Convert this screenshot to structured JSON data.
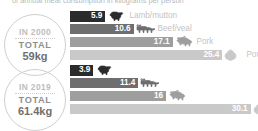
{
  "caption": "of annual meat consumption in kilograms per person",
  "colors": {
    "lamb": "#2b2b2b",
    "beef": "#6e6e6e",
    "pork": "#9e9e9e",
    "poultry": "#c9c9c9",
    "label_text": "#c4c4c4",
    "badge_border": "#cfcfcf",
    "value_text": "#ffffff"
  },
  "badges": [
    {
      "year_label": "IN 2000",
      "total_label": "TOTAL",
      "total_value": "59kg"
    },
    {
      "year_label": "IN 2019",
      "total_label": "TOTAL",
      "total_value": "61.4kg"
    }
  ],
  "groups": [
    {
      "name": "in-2000",
      "rows": [
        {
          "value": "5.9",
          "label": "Lamb/mutton",
          "icon": "sheep-icon",
          "color_key": "lamb",
          "show_label": true
        },
        {
          "value": "10.6",
          "label": "Beef/veal",
          "icon": "cow-icon",
          "color_key": "beef",
          "show_label": true
        },
        {
          "value": "17.1",
          "label": "Pork",
          "icon": "pig-icon",
          "color_key": "pork",
          "show_label": true
        },
        {
          "value": "25.4",
          "label": "Poultry",
          "icon": "chicken-icon",
          "color_key": "poultry",
          "show_label": true
        }
      ]
    },
    {
      "name": "in-2019",
      "rows": [
        {
          "value": "3.9",
          "label": "Lamb/mutton",
          "icon": "sheep-icon",
          "color_key": "lamb",
          "show_label": false
        },
        {
          "value": "11.4",
          "label": "Beef/veal",
          "icon": "cow-icon",
          "color_key": "beef",
          "show_label": false
        },
        {
          "value": "16",
          "label": "Pork",
          "icon": "pig-icon",
          "color_key": "pork",
          "show_label": false
        },
        {
          "value": "30.1",
          "label": "Poultry",
          "icon": "chicken-icon",
          "color_key": "poultry",
          "show_label": false
        }
      ]
    }
  ],
  "chart_data": {
    "type": "bar",
    "title": "of annual meat consumption in kilograms per person",
    "xlabel": "",
    "ylabel": "kilograms per person",
    "unit": "kg",
    "orientation": "horizontal",
    "grid": false,
    "legend": "inline-labels",
    "xlim": [
      0,
      31
    ],
    "categories": [
      "Lamb/mutton",
      "Beef/veal",
      "Pork",
      "Poultry"
    ],
    "series": [
      {
        "name": "IN 2000",
        "total": 59,
        "values": [
          5.9,
          10.6,
          17.1,
          25.4
        ]
      },
      {
        "name": "IN 2019",
        "total": 61.4,
        "values": [
          3.9,
          11.4,
          16,
          30.1
        ]
      }
    ]
  }
}
